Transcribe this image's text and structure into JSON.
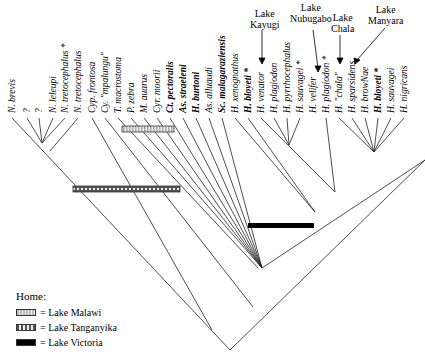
{
  "leaves": [
    {
      "label": "N. brevis",
      "bold": false,
      "x": 12
    },
    {
      "label": "?",
      "bold": false,
      "x": 27
    },
    {
      "label": "?",
      "bold": false,
      "x": 39
    },
    {
      "label": "N. leleupi",
      "bold": false,
      "x": 53
    },
    {
      "label": "N. tretocephalus *",
      "bold": false,
      "x": 65
    },
    {
      "label": "N. tretocephalus",
      "bold": false,
      "x": 78
    },
    {
      "label": "Cyp. frontosa",
      "bold": false,
      "x": 92
    },
    {
      "label": "Cy. \"mpalungu\"",
      "bold": false,
      "x": 105
    },
    {
      "label": "T. macrostoma",
      "bold": false,
      "x": 118
    },
    {
      "label": "P. zebra",
      "bold": false,
      "x": 131
    },
    {
      "label": "M. auarus",
      "bold": false,
      "x": 144
    },
    {
      "label": "Cyr. moorii",
      "bold": false,
      "x": 157
    },
    {
      "label": "Ct. pectoralis",
      "bold": true,
      "x": 170
    },
    {
      "label": "As. straeleni",
      "bold": true,
      "x": 183
    },
    {
      "label": "H. burtoni",
      "bold": true,
      "x": 196
    },
    {
      "label": "As. alluaudi",
      "bold": false,
      "x": 209
    },
    {
      "label": "Sc. malagaraziensis",
      "bold": true,
      "x": 222
    },
    {
      "label": "H. xenognathus",
      "bold": false,
      "x": 235
    },
    {
      "label": "H. bloyeti *",
      "bold": true,
      "x": 248
    },
    {
      "label": "H. venator",
      "bold": false,
      "x": 261
    },
    {
      "label": "H. plagiodon",
      "bold": false,
      "x": 274
    },
    {
      "label": "H. pyrrhocephalus",
      "bold": false,
      "x": 287
    },
    {
      "label": "H. sauvagei *",
      "bold": false,
      "x": 300
    },
    {
      "label": "H. velifer",
      "bold": false,
      "x": 313
    },
    {
      "label": "H. plagiodon *",
      "bold": false,
      "x": 326
    },
    {
      "label": "H. \"chala\"",
      "bold": false,
      "x": 339
    },
    {
      "label": "H. sparsidens",
      "bold": false,
      "x": 352
    },
    {
      "label": "H. browNae",
      "bold": false,
      "x": 365
    },
    {
      "label": "H. bloyeti *",
      "bold": true,
      "x": 378
    },
    {
      "label": "H. sauvagei",
      "bold": false,
      "x": 391
    },
    {
      "label": "H. nigricans",
      "bold": false,
      "x": 404
    }
  ],
  "lakes": [
    {
      "label": "Lake\nKayugi",
      "line1": "Lake",
      "line2": "Kayugi"
    },
    {
      "label": "Lake\nNubugabo",
      "line1": "Lake",
      "line2": "Nubugabo"
    },
    {
      "label": "Lake\nChala",
      "line1": "Lake",
      "line2": "Chala"
    },
    {
      "label": "Lake\nManyara",
      "line1": "Lake",
      "line2": "Manyara"
    }
  ],
  "legend": {
    "title": "Home:",
    "items": [
      {
        "label": "= Lake Malawi"
      },
      {
        "label": "= Lake Tanganyika"
      },
      {
        "label": "= Lake Victoria"
      }
    ]
  },
  "colors": {
    "line": "#222222",
    "victoria": "#000000",
    "background": "#ffffff"
  }
}
